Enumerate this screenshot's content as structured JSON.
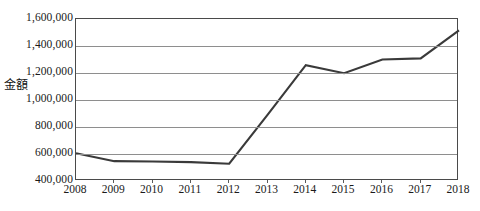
{
  "chart_data": {
    "type": "line",
    "title": "",
    "xlabel": "",
    "ylabel": "金額",
    "categories": [
      "2008",
      "2009",
      "2010",
      "2011",
      "2012",
      "2013",
      "2014",
      "2015",
      "2016",
      "2017",
      "2018"
    ],
    "x": [
      2008,
      2009,
      2010,
      2011,
      2012,
      2013,
      2014,
      2015,
      2016,
      2017,
      2018
    ],
    "series": [
      {
        "name": "金額",
        "values": [
          605000,
          547000,
          545000,
          540000,
          528000,
          890000,
          1258000,
          1198000,
          1300000,
          1308000,
          1515000
        ]
      }
    ],
    "ylim": [
      400000,
      1600000
    ],
    "ytick_values": [
      400000,
      600000,
      800000,
      1000000,
      1200000,
      1400000,
      1600000
    ],
    "ytick_labels": [
      "400,000",
      "600,000",
      "800,000",
      "1,000,000",
      "1,200,000",
      "1,400,000",
      "1,600,000"
    ],
    "xtick_labels": [
      "2008",
      "2009",
      "2010",
      "2011",
      "2012",
      "2013",
      "2014",
      "2015",
      "2016",
      "2017",
      "2018"
    ],
    "grid": "horizontal",
    "legend": "none",
    "line_color": "#3a3a3a",
    "grid_color": "#8e8e8e",
    "frame_color": "#4a4a4a",
    "background_color": "#ffffff"
  },
  "axes": {
    "y_title": "金額"
  }
}
